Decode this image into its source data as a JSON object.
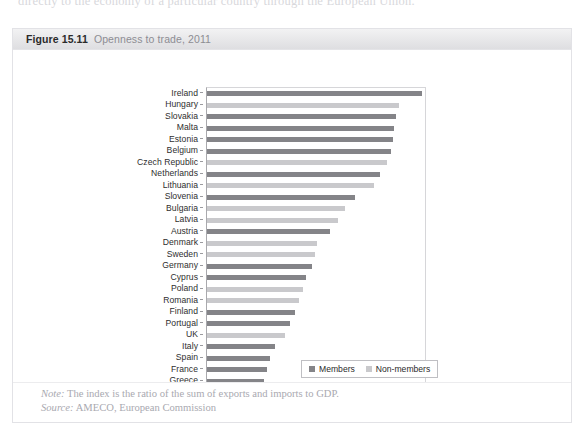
{
  "page": {
    "cropped_top_text": "directly to the economy of a particular country through the European Union."
  },
  "figure": {
    "number": "Figure 15.11",
    "title": "Openness to trade, 2011",
    "note_label": "Note:",
    "note_text": "The index is the ratio of the sum of exports and imports to GDP.",
    "source_label": "Source:",
    "source_text": "AMECO, European Commission"
  },
  "legend": {
    "items": [
      {
        "label": "Members",
        "color": "#848488"
      },
      {
        "label": "Non-members",
        "color": "#c9c9cc"
      }
    ]
  },
  "colors": {
    "members": "#848488",
    "non_members": "#c9c9cc",
    "header_band": "#e7e7e9",
    "axis": "#a9a9ad"
  },
  "chart_data": {
    "type": "bar",
    "orientation": "horizontal",
    "title": "Openness to trade, 2011",
    "xlabel": "",
    "ylabel": "",
    "xlim": [
      0,
      200
    ],
    "xticks": [
      0,
      50,
      100,
      150,
      200
    ],
    "xtick_labels": [
      "0%",
      "50%",
      "100%",
      "150%",
      "200%"
    ],
    "grid": false,
    "legend_position": "bottom-right",
    "series": [
      {
        "name": "Members",
        "color": "#848488"
      },
      {
        "name": "Non-members",
        "color": "#c9c9cc"
      }
    ],
    "categories": [
      "Ireland",
      "Hungary",
      "Slovakia",
      "Malta",
      "Estonia",
      "Belgium",
      "Czech Republic",
      "Netherlands",
      "Lithuania",
      "Slovenia",
      "Bulgaria",
      "Latvia",
      "Austria",
      "Denmark",
      "Sweden",
      "Germany",
      "Cyprus",
      "Poland",
      "Romania",
      "Finland",
      "Portugal",
      "UK",
      "Italy",
      "Spain",
      "France",
      "Greece"
    ],
    "values": [
      197,
      176,
      173,
      172,
      171,
      169,
      165,
      159,
      153,
      136,
      127,
      120,
      113,
      101,
      99,
      96,
      91,
      88,
      84,
      81,
      76,
      72,
      62,
      58,
      55,
      52
    ],
    "groups": [
      "Members",
      "Non-members",
      "Members",
      "Members",
      "Members",
      "Members",
      "Non-members",
      "Members",
      "Non-members",
      "Members",
      "Non-members",
      "Non-members",
      "Members",
      "Non-members",
      "Non-members",
      "Members",
      "Members",
      "Non-members",
      "Non-members",
      "Members",
      "Members",
      "Non-members",
      "Members",
      "Members",
      "Members",
      "Members"
    ],
    "bars": [
      {
        "category": "Ireland",
        "value": 197,
        "group": "Members"
      },
      {
        "category": "Hungary",
        "value": 176,
        "group": "Non-members"
      },
      {
        "category": "Slovakia",
        "value": 173,
        "group": "Members"
      },
      {
        "category": "Malta",
        "value": 172,
        "group": "Members"
      },
      {
        "category": "Estonia",
        "value": 171,
        "group": "Members"
      },
      {
        "category": "Belgium",
        "value": 169,
        "group": "Members"
      },
      {
        "category": "Czech Republic",
        "value": 165,
        "group": "Non-members"
      },
      {
        "category": "Netherlands",
        "value": 159,
        "group": "Members"
      },
      {
        "category": "Lithuania",
        "value": 153,
        "group": "Non-members"
      },
      {
        "category": "Slovenia",
        "value": 136,
        "group": "Members"
      },
      {
        "category": "Bulgaria",
        "value": 127,
        "group": "Non-members"
      },
      {
        "category": "Latvia",
        "value": 120,
        "group": "Non-members"
      },
      {
        "category": "Austria",
        "value": 113,
        "group": "Members"
      },
      {
        "category": "Denmark",
        "value": 101,
        "group": "Non-members"
      },
      {
        "category": "Sweden",
        "value": 99,
        "group": "Non-members"
      },
      {
        "category": "Germany",
        "value": 96,
        "group": "Members"
      },
      {
        "category": "Cyprus",
        "value": 91,
        "group": "Members"
      },
      {
        "category": "Poland",
        "value": 88,
        "group": "Non-members"
      },
      {
        "category": "Romania",
        "value": 84,
        "group": "Non-members"
      },
      {
        "category": "Finland",
        "value": 81,
        "group": "Members"
      },
      {
        "category": "Portugal",
        "value": 76,
        "group": "Members"
      },
      {
        "category": "UK",
        "value": 72,
        "group": "Non-members"
      },
      {
        "category": "Italy",
        "value": 62,
        "group": "Members"
      },
      {
        "category": "Spain",
        "value": 58,
        "group": "Members"
      },
      {
        "category": "France",
        "value": 55,
        "group": "Members"
      },
      {
        "category": "Greece",
        "value": 52,
        "group": "Members"
      }
    ]
  }
}
